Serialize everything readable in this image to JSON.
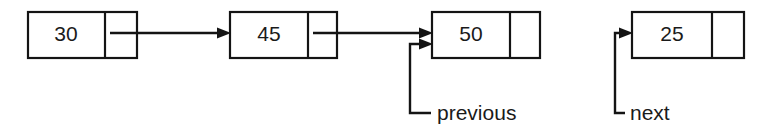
{
  "diagram": {
    "type": "linked-list",
    "background_color": "#ffffff",
    "stroke_color": "#141414",
    "text_color": "#1a1a1a"
  },
  "nodes": [
    {
      "id": "node-30",
      "value": "30",
      "x": 28,
      "y": 12,
      "width": 109,
      "height": 46,
      "divider_x": 105
    },
    {
      "id": "node-45",
      "value": "45",
      "x": 230,
      "y": 12,
      "width": 107,
      "height": 46,
      "divider_x": 308
    },
    {
      "id": "node-50",
      "value": "50",
      "x": 432,
      "y": 12,
      "width": 108,
      "height": 46,
      "divider_x": 510
    },
    {
      "id": "node-25",
      "value": "25",
      "x": 632,
      "y": 12,
      "width": 112,
      "height": 46,
      "divider_x": 712
    }
  ],
  "links": [
    {
      "id": "link-30-to-45",
      "from": "node-30",
      "to": "node-45",
      "x1": 110,
      "y1": 33,
      "x2": 230,
      "y2": 33
    },
    {
      "id": "link-45-to-50",
      "from": "node-45",
      "to": "node-50",
      "x1": 313,
      "y1": 33,
      "x2": 432,
      "y2": 33
    }
  ],
  "pointer_labels": [
    {
      "id": "pointer-previous",
      "label": "previous",
      "label_x": 437,
      "label_baseline_y": 120,
      "elbow_x": 410,
      "elbow_bottom_y": 113,
      "target_x": 432,
      "target_y": 44
    },
    {
      "id": "pointer-next",
      "label": "next",
      "label_x": 630,
      "label_baseline_y": 120,
      "elbow_x": 615,
      "elbow_bottom_y": 113,
      "target_x": 632,
      "target_y": 33
    }
  ]
}
